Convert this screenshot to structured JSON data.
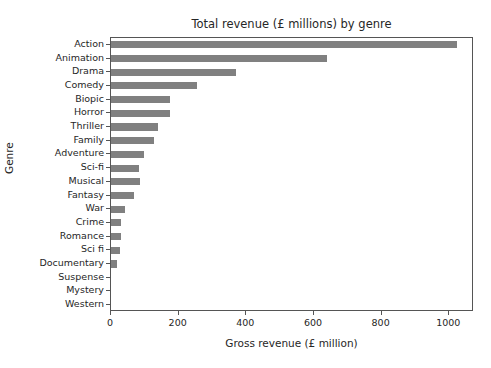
{
  "chart_data": {
    "type": "bar",
    "orientation": "horizontal",
    "title": "Total revenue (£ millions) by genre",
    "xlabel": "Gross revenue (£ million)",
    "ylabel": "Genre",
    "categories": [
      "Action",
      "Animation",
      "Drama",
      "Comedy",
      "Biopic",
      "Horror",
      "Thriller",
      "Family",
      "Adventure",
      "Sci-fi",
      "Musical",
      "Fantasy",
      "War",
      "Crime",
      "Romance",
      "Sci fi",
      "Documentary",
      "Suspense",
      "Mystery",
      "Western"
    ],
    "values": [
      1023,
      638,
      369,
      254,
      175,
      174,
      140,
      128,
      98,
      83,
      86,
      68,
      41,
      30,
      30,
      27,
      18,
      0,
      0,
      0
    ],
    "xlim": [
      0,
      1073
    ],
    "xticks": [
      0,
      200,
      400,
      600,
      800,
      1000
    ],
    "xtick_labels": [
      "0",
      "200",
      "400",
      "600",
      "800",
      "1000"
    ],
    "grid": false,
    "legend": null,
    "bar_color": "#808080",
    "axes_color": "#555555",
    "text_color": "#262626",
    "background": "#ffffff"
  }
}
